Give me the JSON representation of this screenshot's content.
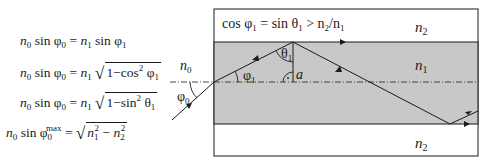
{
  "equations": [
    {
      "lhs": "n0 sin φ0",
      "rhs": "n1 sin φ1"
    },
    {
      "lhs": "n0 sin φ0",
      "rhs": "n1 √(1 − cos² φ1)"
    },
    {
      "lhs": "n0 sin φ0",
      "rhs": "n1 √(1 − sin² θ1)"
    },
    {
      "lhs": "n0 sin φ0^max",
      "rhs": "√(n1² − n2²)"
    }
  ],
  "diagram": {
    "condition": {
      "cos": "cos φ",
      "sub1": "1",
      "eq": " = sin θ",
      "sub2": "1",
      "gt": " > n",
      "sub3": "2",
      "slash": "/n",
      "sub4": "1"
    },
    "labels": {
      "n0": "n",
      "n0_sub": "0",
      "phi0": "φ",
      "phi0_sub": "0",
      "phi1": "φ",
      "phi1_sub": "1",
      "theta1": "θ",
      "theta1_sub": "1",
      "a": "a",
      "n1": "n",
      "n1_sub": "1",
      "n2_top": "n",
      "n2_top_sub": "2",
      "n2_bottom": "n",
      "n2_bottom_sub": "2"
    },
    "colors": {
      "core_fill": "#c8c8c8",
      "cladding_fill": "#ffffff",
      "line": "#1a1a1a"
    }
  }
}
